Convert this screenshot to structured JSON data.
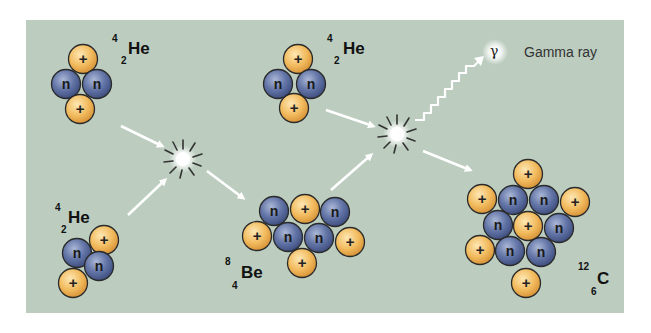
{
  "diagram": {
    "colors": {
      "background": "#bccdbf",
      "proton": "#f0b85a",
      "neutron": "#5a6ea0",
      "arrow": "#ffffff",
      "outline": "#2a2a2a"
    },
    "particle_labels": {
      "proton": "+",
      "neutron": "n"
    },
    "nuclei": [
      {
        "id": "he4-top-left",
        "symbol": "He",
        "mass_number": "4",
        "atomic_number": "2"
      },
      {
        "id": "he4-top-middle",
        "symbol": "He",
        "mass_number": "4",
        "atomic_number": "2"
      },
      {
        "id": "he4-bottom-left",
        "symbol": "He",
        "mass_number": "4",
        "atomic_number": "2"
      },
      {
        "id": "be8",
        "symbol": "Be",
        "mass_number": "8",
        "atomic_number": "4"
      },
      {
        "id": "c12",
        "symbol": "C",
        "mass_number": "12",
        "atomic_number": "6"
      }
    ],
    "gamma": {
      "symbol": "γ",
      "label": "Gamma ray"
    },
    "icons": [
      "collision-burst-icon",
      "arrow-icon",
      "wavy-arrow-icon"
    ]
  }
}
